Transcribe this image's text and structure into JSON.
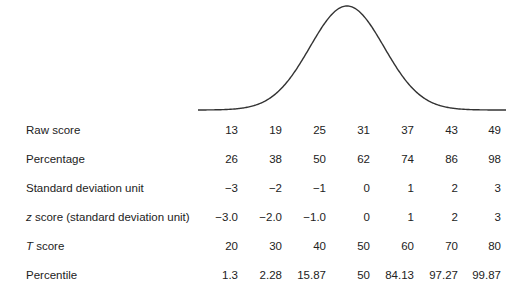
{
  "chart_data": {
    "type": "table",
    "title": "",
    "figure": "normal distribution curve with score conversion table",
    "columns": 7,
    "rows": [
      {
        "label": "Raw score",
        "italic_prefix": "",
        "rest": "Raw score",
        "values": [
          "13",
          "19",
          "25",
          "31",
          "37",
          "43",
          "49"
        ]
      },
      {
        "label": "Percentage",
        "italic_prefix": "",
        "rest": "Percentage",
        "values": [
          "26",
          "38",
          "50",
          "62",
          "74",
          "86",
          "98"
        ]
      },
      {
        "label": "Standard deviation unit",
        "italic_prefix": "",
        "rest": "Standard deviation unit",
        "values": [
          "−3",
          "−2",
          "−1",
          "0",
          "1",
          "2",
          "3"
        ]
      },
      {
        "label": "z score (standard deviation unit)",
        "italic_prefix": "z",
        "rest": " score (standard deviation unit)",
        "values": [
          "−3.0",
          "−2.0",
          "−1.0",
          "0",
          "1",
          "2",
          "3"
        ]
      },
      {
        "label": "T score",
        "italic_prefix": "T",
        "rest": " score",
        "values": [
          "20",
          "30",
          "40",
          "50",
          "60",
          "70",
          "80"
        ]
      },
      {
        "label": "Percentile",
        "italic_prefix": "",
        "rest": "Percentile",
        "values": [
          "1.3",
          "2.28",
          "15.87",
          "50",
          "84.13",
          "97.27",
          "99.87"
        ]
      }
    ],
    "curve": {
      "shape": "normal",
      "mean_column": 4,
      "color": "#333333"
    }
  }
}
